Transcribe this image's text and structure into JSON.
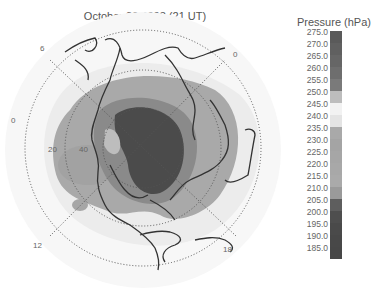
{
  "chart_data": {
    "type": "heatmap",
    "subtype": "polar stereographic contour map (Northern Hemisphere)",
    "title": "October 29 2003 (21 UT)",
    "colorbar": {
      "title": "Pressure (hPa)",
      "ticks": [
        "275.0",
        "270.0",
        "265.0",
        "260.0",
        "255.0",
        "250.0",
        "245.0",
        "240.0",
        "235.0",
        "230.0",
        "225.0",
        "220.0",
        "215.0",
        "210.0",
        "205.0",
        "200.0",
        "195.0",
        "190.0",
        "185.0"
      ],
      "colors": [
        "#5a5a5a",
        "#606060",
        "#666666",
        "#6e6e6e",
        "#7a7a7a",
        "#bdbdbd",
        "#f2f2f2",
        "#e4e4e4",
        "#a9a9a9",
        "#a4a4a4",
        "#a6a6a6",
        "#a8a8a8",
        "#aaaaaa",
        "#9a9a9a",
        "#5e5e5e",
        "#4e4e4e",
        "#4a4a4a",
        "#484848",
        "#474747"
      ]
    },
    "latitude_labels": [
      "20",
      "40"
    ],
    "local_time_labels": [
      "6",
      "0",
      "0",
      "12",
      "18"
    ],
    "contours": [
      {
        "level": "~220-235 hPa",
        "color": "#a8a8a8",
        "region": "broad polar cap over Arctic/N. America"
      },
      {
        "level": "~205-210 hPa",
        "color": "#8a8a8a",
        "region": "ring around pole"
      },
      {
        "level": "~185-200 hPa",
        "color": "#4a4a4a",
        "region": "central low over Arctic/Hudson Bay"
      },
      {
        "level": "~240-245 hPa",
        "color": "#e6e6e6",
        "region": "mid-latitudes surround"
      }
    ],
    "grid": true,
    "legend_position": "right"
  },
  "labels": {
    "lt6": "6",
    "lt0_right": "0",
    "lt0_left": "0",
    "lt12": "12",
    "lt18": "18",
    "lat20": "20",
    "lat40": "40"
  }
}
